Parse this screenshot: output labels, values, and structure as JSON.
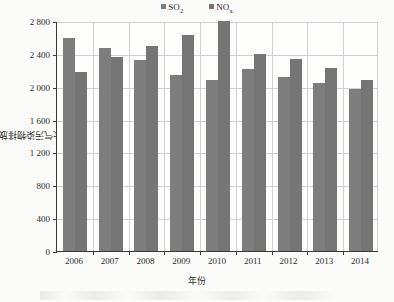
{
  "chart_data": {
    "type": "bar",
    "title": "",
    "xlabel": "年份",
    "ylabel": "大气污染物排放量/万t",
    "ylim": [
      0,
      2800
    ],
    "ytick_step": 400,
    "ytick_labels": [
      "0",
      "400",
      "800",
      "1 200",
      "1 600",
      "2 000",
      "2 400",
      "2 800"
    ],
    "ytick_values": [
      0,
      400,
      800,
      1200,
      1600,
      2000,
      2400,
      2800
    ],
    "grid": true,
    "legend_position": "top-center",
    "categories": [
      "2006",
      "2007",
      "2008",
      "2009",
      "2010",
      "2011",
      "2012",
      "2013",
      "2014"
    ],
    "series": [
      {
        "name": "SO2",
        "name_base": "SO",
        "name_sub": "2",
        "color": "#7d7d7d",
        "values": [
          2589,
          2468,
          2321,
          2142,
          2085,
          2218,
          2118,
          2044,
          1974
        ]
      },
      {
        "name": "NOx",
        "name_base": "NO",
        "name_sub": "x",
        "color": "#757575",
        "values": [
          2176,
          2360,
          2493,
          2625,
          2798,
          2404,
          2338,
          2227,
          2078
        ]
      }
    ]
  },
  "legend": {
    "entries": [
      {
        "label_base": "SO",
        "label_sub": "2",
        "swatch_color": "#7d7d7d"
      },
      {
        "label_base": "NO",
        "label_sub": "x",
        "swatch_color": "#757575"
      }
    ]
  },
  "axes": {
    "y_title": "大气污染物排放量/万t",
    "x_title": "年份"
  }
}
